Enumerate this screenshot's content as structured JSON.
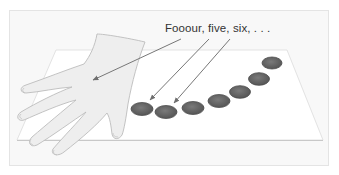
{
  "figure": {
    "caption": "Fooour, five, six, . . .",
    "colors": {
      "frame_border": "#e6e6e6",
      "frame_fill": "#f7f7f7",
      "sheet_fill": "#ffffff",
      "sheet_edge": "#cfcfcf",
      "hand_fill": "#ececec",
      "hand_stroke": "#bdbdbd",
      "coin_fill": "#6a6a6a",
      "coin_rim": "#4a4a4a",
      "arrow": "#777777"
    },
    "objects": {
      "hand": "left hand resting on table",
      "coins_count": 7,
      "arrows_count": 3
    }
  }
}
